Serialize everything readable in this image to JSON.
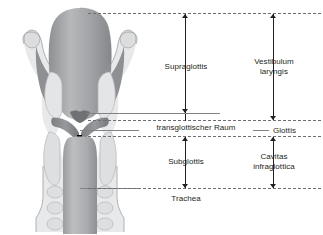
{
  "figure": {
    "illustration_name": "larynx-coronal-section"
  },
  "labels": {
    "supraglottis": "Supraglottis",
    "vestibulum_laryngis": "Vestibulum\nlaryngis",
    "vestibulum_laryngis_line1": "Vestibulum",
    "vestibulum_laryngis_line2": "laryngis",
    "transglottischer_raum": "transglottischer Raum",
    "glottis": "Glottis",
    "subglottis": "Subglottis",
    "cavitas_infraglottica_line1": "Cavitas",
    "cavitas_infraglottica_line2": "infraglottica",
    "trachea": "Trachea"
  },
  "colors": {
    "text": "#231f20",
    "dashed_line": "#6d6e71",
    "solid_line": "#808285",
    "arrow": "#231f20",
    "cartilage_light": "#d9dadb",
    "cartilage_mid": "#b9bbbd",
    "mucosa_dark": "#8b8d90",
    "lumen": "#a7a9ac",
    "outline": "#939598",
    "background": "#ffffff"
  }
}
